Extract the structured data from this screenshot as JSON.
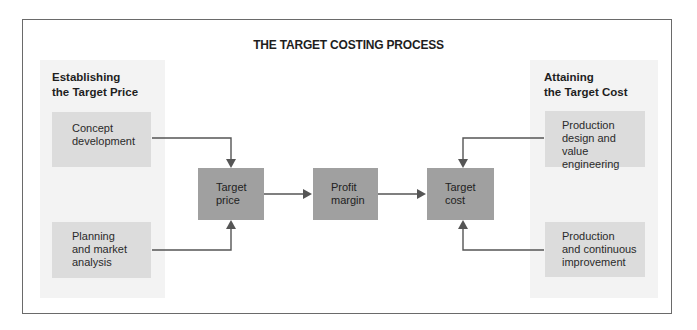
{
  "title": "THE TARGET COSTING PROCESS",
  "left_section": {
    "heading_line1": "Establishing",
    "heading_line2": "the Target Price",
    "boxes": [
      {
        "lines": [
          "Concept",
          "development"
        ]
      },
      {
        "lines": [
          "Planning",
          "and market",
          "analysis"
        ]
      }
    ]
  },
  "center": {
    "boxes": [
      {
        "lines": [
          "Target",
          "price"
        ]
      },
      {
        "lines": [
          "Profit",
          "margin"
        ]
      },
      {
        "lines": [
          "Target",
          "cost"
        ]
      }
    ]
  },
  "right_section": {
    "heading_line1": "Attaining",
    "heading_line2": "the Target Cost",
    "boxes": [
      {
        "lines": [
          "Production",
          "design and",
          "value engineering"
        ]
      },
      {
        "lines": [
          "Production",
          "and continuous",
          "improvement"
        ]
      }
    ]
  },
  "colors": {
    "frame": "#6a6a6a",
    "panel_bg": "#f3f3f3",
    "light_box": "#dcdcdc",
    "dark_box": "#a0a0a0",
    "arrow": "#555555"
  }
}
